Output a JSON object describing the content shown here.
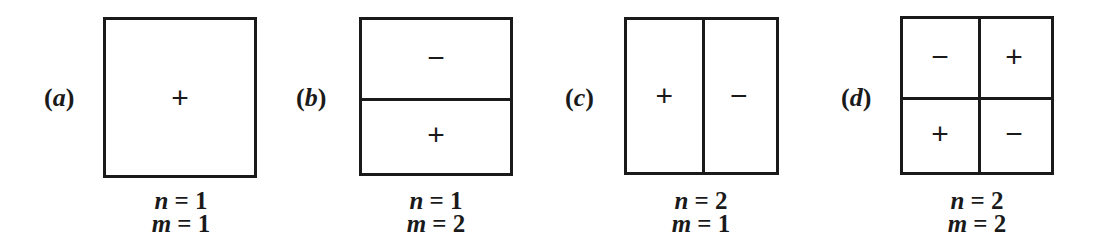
{
  "panels": [
    {
      "id": "a",
      "label_open": "(",
      "label_letter": "a",
      "label_close": ")",
      "division": "none",
      "signs": [
        "+"
      ],
      "n_var": "n",
      "n_eq": " = ",
      "n_val": "1",
      "m_var": "m",
      "m_eq": " = ",
      "m_val": "1"
    },
    {
      "id": "b",
      "label_open": "(",
      "label_letter": "b",
      "label_close": ")",
      "division": "horizontal",
      "signs": [
        "−",
        "+"
      ],
      "n_var": "n",
      "n_eq": " = ",
      "n_val": "1",
      "m_var": "m",
      "m_eq": " = ",
      "m_val": "2"
    },
    {
      "id": "c",
      "label_open": "(",
      "label_letter": "c",
      "label_close": ")",
      "division": "vertical",
      "signs": [
        "+",
        "−"
      ],
      "n_var": "n",
      "n_eq": " = ",
      "n_val": "2",
      "m_var": "m",
      "m_eq": " = ",
      "m_val": "1"
    },
    {
      "id": "d",
      "label_open": "(",
      "label_letter": "d",
      "label_close": ")",
      "division": "quad",
      "signs": [
        "−",
        "+",
        "+",
        "−"
      ],
      "n_var": "n",
      "n_eq": " = ",
      "n_val": "2",
      "m_var": "m",
      "m_eq": " = ",
      "m_val": "2"
    }
  ]
}
